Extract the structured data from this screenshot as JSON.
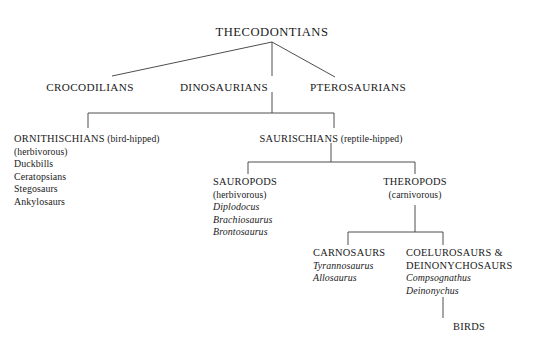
{
  "diagram": {
    "title_node": "THECODONTIANS",
    "level2": {
      "crocodilians": "CROCODILIANS",
      "dinosaurians": "DINOSAURIANS",
      "pterosaurians": "PTEROSAURIANS"
    },
    "ornithischians": {
      "heading_caps": "ORNITHISCHIANS",
      "heading_note": "(bird-hipped)",
      "diet": "(herbivorous)",
      "members": [
        "Duckbills",
        "Ceratopsians",
        "Stegosaurs",
        "Ankylosaurs"
      ]
    },
    "saurischians": {
      "heading_caps": "SAURISCHIANS",
      "heading_note": "(reptile-hipped)"
    },
    "sauropods": {
      "heading": "SAUROPODS",
      "diet": "(herbivorous)",
      "genera": [
        "Diplodocus",
        "Brachiosaurus",
        "Brontosaurus"
      ]
    },
    "theropods": {
      "heading": "THEROPODS",
      "diet": "(carnivorous)"
    },
    "carnosaurs": {
      "heading": "CARNOSAURS",
      "genera": [
        "Tyrannosaurus",
        "Allosaurus"
      ]
    },
    "coelurosaurs": {
      "heading_line1": "COELUROSAURS &",
      "heading_line2": "DEINONYCHOSAURS",
      "genera": [
        "Compsognathus",
        "Deinonychus"
      ]
    },
    "birds": "BIRDS",
    "colors": {
      "background": "#ffffff",
      "text": "#1a1a1a",
      "line": "#3a3a3a"
    }
  }
}
